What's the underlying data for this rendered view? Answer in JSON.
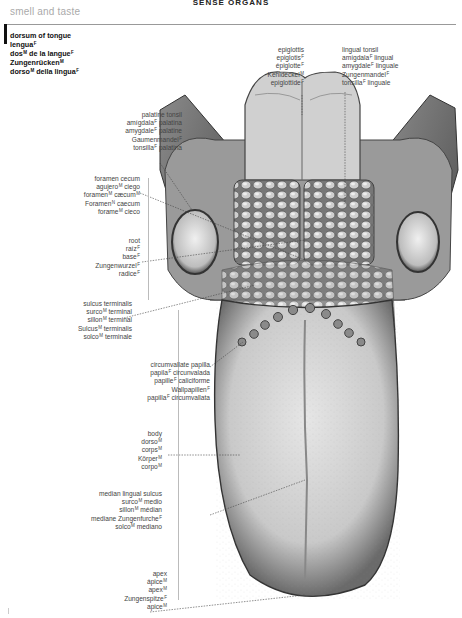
{
  "running_head": "SENSE ORGANS",
  "section_title": "smell and taste",
  "head_term": {
    "lines": [
      {
        "text": "dorsum of tongue",
        "sup": ""
      },
      {
        "text": "lengua",
        "sup": "F"
      },
      {
        "text": "dos",
        "sup": "M",
        "text2": " de la langue",
        "sup2": "F"
      },
      {
        "text": "Zungenrücken",
        "sup": "M"
      },
      {
        "text": "dorso",
        "sup": "M",
        "text2": " della lingua",
        "sup2": "F"
      }
    ]
  },
  "labels": {
    "epiglottis": [
      "epiglottis",
      "epiglotis F",
      "épiglotte F",
      "Kehldeckel M",
      "epiglottide F"
    ],
    "lingual_tonsil": [
      "lingual tonsil",
      "amígdala F lingual",
      "amygdale F linguale",
      "Zungenmandel F",
      "tonsilla F linguale"
    ],
    "palatine_tonsil": [
      "palatine tonsil",
      "amígdala F palatina",
      "amygdale F palatine",
      "Gaumenmandel F",
      "tonsilla F palatina"
    ],
    "foramen_cecum": [
      "foramen cecum",
      "agujero M ciego",
      "foramen M cæcum M",
      "Foramen N caecum",
      "forame M cieco"
    ],
    "root": [
      "root",
      "raíz F",
      "base F",
      "Zungenwurzel F",
      "radice F"
    ],
    "sulcus_terminalis": [
      "sulcus terminalis",
      "surco M terminal",
      "sillon M terminal",
      "Sulcus M terminalis",
      "solco M terminale"
    ],
    "circumvallate_papilla": [
      "circumvallate papilla",
      "papila F circunvalada",
      "papille F caliciforme",
      "Wallpapillen F",
      "papilla F circumvallata"
    ],
    "body": [
      "body",
      "dorso M",
      "corps M",
      "Körper M",
      "corpo M"
    ],
    "median_lingual_sulcus": [
      "median lingual sulcus",
      "surco M medio",
      "sillon M médian",
      "mediane Zungenfurche F",
      "solco M mediano"
    ],
    "apex": [
      "apex",
      "ápice M",
      "apex M",
      "Zungenspitze F",
      "apice M"
    ]
  },
  "colors": {
    "text": "#444444",
    "heading": "#111111",
    "section": "#aaaaaa",
    "rule": "#999999"
  }
}
